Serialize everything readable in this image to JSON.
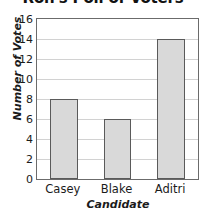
{
  "chart_data": {
    "type": "bar",
    "title": "Ron's Poll of Voters",
    "xlabel": "Candidate",
    "ylabel": "Number of Votes",
    "categories": [
      "Casey",
      "Blake",
      "Aditri"
    ],
    "values": [
      8,
      6,
      14
    ],
    "ylim": [
      0,
      16
    ],
    "yticks": [
      0,
      2,
      4,
      6,
      8,
      10,
      12,
      14,
      16
    ],
    "ytick_labels": [
      "0",
      "2",
      "4",
      "6",
      "8",
      "10",
      "12",
      "14",
      "16"
    ],
    "grid": "horizontal",
    "legend": "none",
    "colors": {
      "bar_fill": "#d9d9d9",
      "bar_edge": "#5a5a5a",
      "gridline": "#d2d2d2",
      "frame": "#6b6b6b",
      "background": "#ffffff",
      "text": "#1b1b1b"
    }
  }
}
